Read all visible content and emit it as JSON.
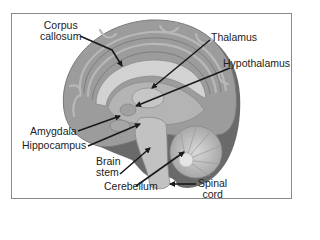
{
  "diagram": {
    "type": "labeled-anatomy",
    "labels": {
      "corpus_callosum": {
        "line1": "Corpus",
        "line2": "callosum"
      },
      "thalamus": "Thalamus",
      "hypothalamus": "Hypothalamus",
      "amygdala": "Amygdala",
      "hippocampus": "Hippocampus",
      "brain_stem": {
        "line1": "Brain",
        "line2": "stem"
      },
      "cerebellum": "Cerebellum",
      "spinal_cord": {
        "line1": "Spinal",
        "line2": "cord"
      }
    },
    "colors": {
      "frame": "#8a8a8a",
      "cortex": "#9a9a9a",
      "cortex_dark": "#6e6e6e",
      "inner": "#c4c4c4",
      "arrow": "#1a1a1a",
      "text": "#222222"
    }
  }
}
